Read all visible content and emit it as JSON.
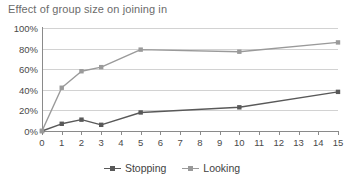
{
  "chart_data": {
    "type": "line",
    "title": "Effect of group size on joining in",
    "xlabel": "",
    "ylabel": "",
    "x": [
      0,
      1,
      2,
      3,
      5,
      10,
      15
    ],
    "xlim": [
      0,
      15
    ],
    "ylim": [
      0,
      100
    ],
    "xticks": [
      "0",
      "1",
      "2",
      "3",
      "4",
      "5",
      "6",
      "7",
      "8",
      "9",
      "10",
      "11",
      "12",
      "13",
      "14",
      "15"
    ],
    "yticks": [
      "0%",
      "20%",
      "40%",
      "60%",
      "80%",
      "100%"
    ],
    "ytick_values": [
      0,
      20,
      40,
      60,
      80,
      100
    ],
    "grid": true,
    "legend_position": "bottom",
    "series": [
      {
        "name": "Stopping",
        "color": "#595959",
        "values": [
          0,
          7,
          11,
          6,
          18,
          23,
          38
        ]
      },
      {
        "name": "Looking",
        "color": "#9a9a9a",
        "values": [
          0,
          42,
          58,
          62,
          79,
          77,
          86
        ]
      }
    ]
  },
  "legend": {
    "items": [
      {
        "label": "Stopping",
        "color": "#595959"
      },
      {
        "label": "Looking",
        "color": "#9a9a9a"
      }
    ]
  },
  "colors": {
    "grid": "#d2d2d2",
    "axis": "#8a8a8a",
    "title_text": "#6b6b6b",
    "tick_text": "#4a4a4a",
    "background": "#ffffff"
  }
}
